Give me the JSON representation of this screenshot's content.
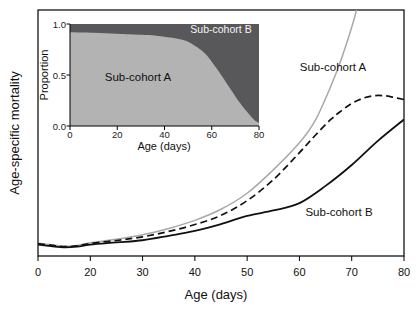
{
  "colors": {
    "background": "#ffffff",
    "axis_black": "#000000",
    "gray_curve": "#a8a8a8",
    "dashed_curve": "#111111",
    "solid_curve": "#111111",
    "inset_area_light": "#b3b3b3",
    "inset_area_dark": "#58585a",
    "inset_label_light": "#f5f5f5"
  },
  "main_plot": {
    "ylabel": "Age-specific mortality",
    "xlabel": "Age (days)",
    "curve_label_a": "Sub-cohort A",
    "curve_label_b": "Sub-cohort B"
  },
  "inset": {
    "ylabel": "Proportion",
    "xlabel": "Age (days)",
    "area_label_a": "Sub-cohort A",
    "area_label_b": "Sub-cohort B"
  },
  "chart_data": [
    {
      "id": "main",
      "type": "line",
      "xlabel": "Age (days)",
      "ylabel": "Age-specific mortality",
      "x_ticks": [
        0,
        20,
        30,
        40,
        50,
        60,
        70,
        80
      ],
      "x_tick_labels": [
        "0",
        "20",
        "30",
        "40",
        "50",
        "60",
        "70",
        "80"
      ],
      "x_axis_note": "ticks evenly spaced although first interval spans 0-20 days",
      "y_axis_note": "no tick labels; y values given as relative mortality, 0-1 of plot height",
      "ylim": [
        0,
        1
      ],
      "grid": false,
      "series": [
        {
          "name": "Sub-cohort A",
          "style": "solid",
          "color_key": "gray_curve",
          "width": 1.5,
          "points": [
            [
              0,
              0.052
            ],
            [
              5,
              0.046
            ],
            [
              10,
              0.04
            ],
            [
              15,
              0.043
            ],
            [
              20,
              0.054
            ],
            [
              25,
              0.068
            ],
            [
              30,
              0.086
            ],
            [
              35,
              0.112
            ],
            [
              40,
              0.145
            ],
            [
              45,
              0.19
            ],
            [
              50,
              0.255
            ],
            [
              55,
              0.35
            ],
            [
              60,
              0.46
            ],
            [
              63,
              0.55
            ],
            [
              66,
              0.69
            ],
            [
              68,
              0.8
            ],
            [
              70,
              0.93
            ],
            [
              71.3,
              1.03
            ]
          ]
        },
        {
          "name": "Whole cohort (dashed)",
          "style": "dashed",
          "color_key": "dashed_curve",
          "width": 1.7,
          "points": [
            [
              0,
              0.05
            ],
            [
              5,
              0.044
            ],
            [
              10,
              0.038
            ],
            [
              15,
              0.041
            ],
            [
              20,
              0.051
            ],
            [
              25,
              0.063
            ],
            [
              30,
              0.078
            ],
            [
              35,
              0.1
            ],
            [
              40,
              0.128
            ],
            [
              45,
              0.165
            ],
            [
              50,
              0.225
            ],
            [
              55,
              0.31
            ],
            [
              60,
              0.42
            ],
            [
              63,
              0.49
            ],
            [
              66,
              0.555
            ],
            [
              68,
              0.59
            ],
            [
              70,
              0.62
            ],
            [
              72,
              0.64
            ],
            [
              74,
              0.651
            ],
            [
              76,
              0.652
            ],
            [
              78,
              0.645
            ],
            [
              80,
              0.636
            ]
          ]
        },
        {
          "name": "Sub-cohort B",
          "style": "solid",
          "color_key": "solid_curve",
          "width": 1.8,
          "points": [
            [
              0,
              0.046
            ],
            [
              5,
              0.04
            ],
            [
              10,
              0.035
            ],
            [
              15,
              0.038
            ],
            [
              20,
              0.046
            ],
            [
              25,
              0.055
            ],
            [
              30,
              0.064
            ],
            [
              35,
              0.082
            ],
            [
              40,
              0.102
            ],
            [
              45,
              0.13
            ],
            [
              50,
              0.163
            ],
            [
              55,
              0.185
            ],
            [
              60,
              0.215
            ],
            [
              65,
              0.285
            ],
            [
              70,
              0.37
            ],
            [
              75,
              0.468
            ],
            [
              80,
              0.555
            ]
          ]
        }
      ]
    },
    {
      "id": "inset",
      "type": "area",
      "xlabel": "Age (days)",
      "ylabel": "Proportion",
      "x_ticks": [
        0,
        20,
        40,
        60,
        80
      ],
      "x_tick_labels": [
        "0",
        "20",
        "40",
        "60",
        "80"
      ],
      "y_ticks": [
        1.0,
        0.5,
        0.0
      ],
      "y_tick_labels": [
        "1.0",
        "0.5",
        "0.0"
      ],
      "xlim": [
        0,
        80
      ],
      "ylim": [
        0,
        1
      ],
      "grid": false,
      "series": [
        {
          "name": "Sub-cohort A",
          "role": "lower_area",
          "color_key": "inset_area_light",
          "points": [
            [
              0,
              0.92
            ],
            [
              10,
              0.915
            ],
            [
              20,
              0.905
            ],
            [
              30,
              0.895
            ],
            [
              35,
              0.89
            ],
            [
              40,
              0.875
            ],
            [
              45,
              0.858
            ],
            [
              48,
              0.843
            ],
            [
              50,
              0.825
            ],
            [
              52,
              0.8
            ],
            [
              54,
              0.77
            ],
            [
              56,
              0.735
            ],
            [
              58,
              0.69
            ],
            [
              60,
              0.63
            ],
            [
              62,
              0.565
            ],
            [
              64,
              0.5
            ],
            [
              66,
              0.43
            ],
            [
              68,
              0.36
            ],
            [
              70,
              0.29
            ],
            [
              72,
              0.225
            ],
            [
              74,
              0.165
            ],
            [
              76,
              0.11
            ],
            [
              78,
              0.06
            ],
            [
              80,
              0.03
            ]
          ]
        },
        {
          "name": "Sub-cohort B",
          "role": "upper_area",
          "color_key": "inset_area_dark",
          "note": "proportion = 1 - Sub-cohort A"
        }
      ]
    }
  ]
}
